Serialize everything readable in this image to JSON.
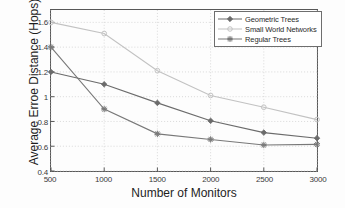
{
  "chart_data": {
    "type": "line",
    "title": "",
    "xlabel": "Number of Monitors",
    "ylabel": "Average Erroe Distance (Hops)",
    "x": [
      500,
      1000,
      1500,
      2000,
      2500,
      3000
    ],
    "xlim": [
      500,
      3000
    ],
    "ylim": [
      0.4,
      1.7
    ],
    "xticks": [
      "500",
      "1000",
      "1500",
      "2000",
      "2500",
      "3000"
    ],
    "yticks": [
      "0.4",
      "0.6",
      "0.8",
      "1",
      "1.2",
      "1.4",
      "1.6"
    ],
    "grid": true,
    "legend_position": "top-right",
    "series": [
      {
        "name": "Geometric Trees",
        "marker": "diamond",
        "color": "#6b6b6b",
        "values": [
          1.2,
          1.1,
          0.95,
          0.805,
          0.71,
          0.665
        ]
      },
      {
        "name": "Small World Networks",
        "marker": "circle",
        "color": "#c2c2c2",
        "values": [
          1.6,
          1.51,
          1.21,
          1.01,
          0.915,
          0.815
        ]
      },
      {
        "name": "Regular Trees",
        "marker": "star",
        "color": "#787878",
        "values": [
          1.4,
          0.9,
          0.7,
          0.655,
          0.61,
          0.615
        ]
      }
    ]
  },
  "legend": {
    "items": [
      {
        "label": "Geometric Trees"
      },
      {
        "label": "Small World Networks"
      },
      {
        "label": "Regular Trees"
      }
    ]
  },
  "colors": {
    "axis": "#575757",
    "grid": "#c9c9c9",
    "background": "#fdfdfd",
    "text": "#1d1d1d"
  }
}
